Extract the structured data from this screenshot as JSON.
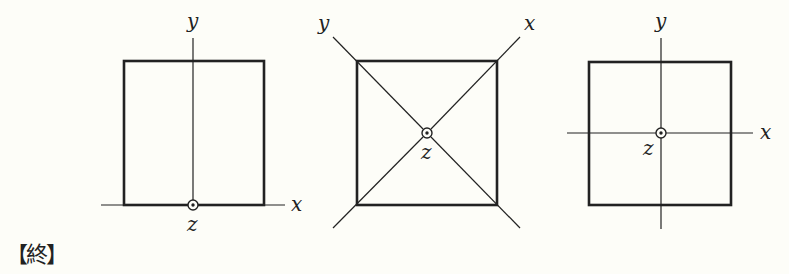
{
  "figures": [
    {
      "id": "left",
      "description": "Square with z-axis at midpoint of bottom edge",
      "labels": {
        "x": "x",
        "y": "y",
        "z": "z"
      }
    },
    {
      "id": "middle",
      "description": "Square with x and y axes along diagonals, z-axis at center",
      "labels": {
        "x": "x",
        "y": "y",
        "z": "z"
      }
    },
    {
      "id": "right",
      "description": "Square with x and y axes through center, z-axis at center",
      "labels": {
        "x": "x",
        "y": "y",
        "z": "z"
      }
    }
  ],
  "end_mark": "【終】",
  "colors": {
    "line": "#222222",
    "background": "#fdfdf8"
  }
}
